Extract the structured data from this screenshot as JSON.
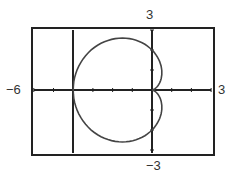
{
  "chart_data": {
    "type": "line",
    "title": "",
    "xlabel": "",
    "ylabel": "",
    "xlim": [
      -6,
      3
    ],
    "ylim": [
      -3,
      3
    ],
    "x_tick_step": 1,
    "y_tick_step": 1,
    "grid": false,
    "tick_labels": {
      "xmin": "−6",
      "xmax": "3",
      "ymax": "3",
      "ymin": "−3"
    },
    "vertical_line_x": -4,
    "series": [
      {
        "name": "r = 2 - 2cos(theta)",
        "x": [
          0,
          -0.2,
          -1,
          -2,
          -3,
          -3.6,
          -4,
          -3.6,
          -3,
          -2,
          -1,
          -0.2,
          0
        ],
        "y": [
          0,
          1.0,
          2.2,
          2.6,
          2.2,
          1.2,
          0,
          -1.2,
          -2.2,
          -2.6,
          -2.2,
          -1.0,
          0
        ]
      }
    ]
  },
  "labels": {
    "xmin": "−6",
    "xmax": "3",
    "ymax": "3",
    "ymin": "−3"
  }
}
